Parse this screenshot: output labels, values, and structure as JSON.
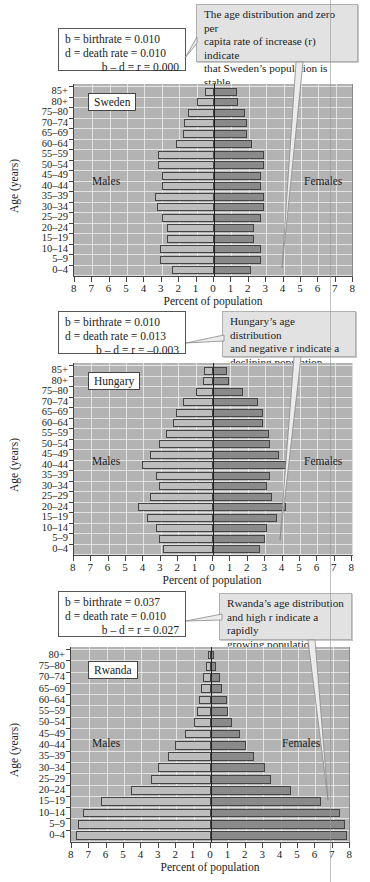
{
  "axis": {
    "x_ticks": [
      "8",
      "7",
      "6",
      "5",
      "4",
      "3",
      "2",
      "1",
      "0",
      "1",
      "2",
      "3",
      "4",
      "5",
      "6",
      "7",
      "8"
    ],
    "x_title": "Percent of population",
    "y_title": "Age (years)",
    "males_label": "Males",
    "females_label": "Females"
  },
  "panels": [
    {
      "country": "Sweden",
      "stats": {
        "b": "b =  birthrate = 0.010",
        "d": "d = death rate = 0.010",
        "r": "b – d = r = 0.000"
      },
      "callout": [
        "The age distribution and zero per",
        "capita rate of increase (r) indicate",
        "that Sweden’s population is stable."
      ]
    },
    {
      "country": "Hungary",
      "stats": {
        "b": "b =  birthrate = 0.010",
        "d": "d = death rate = 0.013",
        "r": "b – d = r = –0.003"
      },
      "callout": [
        "Hungary’s age distribution",
        "and negative r indicate a",
        "declining population."
      ]
    },
    {
      "country": "Rwanda",
      "stats": {
        "b": "b =  birthrate = 0.037",
        "d": "d = death rate = 0.010",
        "r": "b – d = r = 0.027"
      },
      "callout": [
        "Rwanda’s age distribution",
        "and high r indicate a rapidly",
        "growing population."
      ]
    }
  ],
  "chart_data": [
    {
      "type": "bar",
      "orientation": "horizontal-population-pyramid",
      "title": "Sweden",
      "xlabel": "Percent of population",
      "ylabel": "Age (years)",
      "xlim": [
        -8,
        8
      ],
      "grid": true,
      "categories": [
        "85+",
        "80+",
        "75–80",
        "70–74",
        "65–69",
        "60–64",
        "55–59",
        "50–54",
        "45–49",
        "40–44",
        "35–39",
        "30–34",
        "25–29",
        "20–24",
        "15–19",
        "10–14",
        "5–9",
        "0–4"
      ],
      "series": [
        {
          "name": "Males",
          "values": [
            0.5,
            1.0,
            1.5,
            1.7,
            1.8,
            2.2,
            3.2,
            3.2,
            3.0,
            3.0,
            3.4,
            3.3,
            3.0,
            2.7,
            2.7,
            3.1,
            3.1,
            2.4
          ]
        },
        {
          "name": "Females",
          "values": [
            1.3,
            1.4,
            1.8,
            1.9,
            1.9,
            2.2,
            2.9,
            2.9,
            2.7,
            2.7,
            2.9,
            2.9,
            2.7,
            2.3,
            2.3,
            2.7,
            2.7,
            2.1
          ]
        }
      ],
      "annotations": [
        "b = birthrate = 0.010",
        "d = death rate = 0.010",
        "b – d = r = 0.000",
        "The age distribution and zero per capita rate of increase (r) indicate that Sweden’s population is stable."
      ]
    },
    {
      "type": "bar",
      "orientation": "horizontal-population-pyramid",
      "title": "Hungary",
      "xlabel": "Percent of population",
      "ylabel": "Age (years)",
      "xlim": [
        -8,
        8
      ],
      "grid": true,
      "categories": [
        "85+",
        "80+",
        "75–80",
        "70–74",
        "65–69",
        "60–64",
        "55–59",
        "50–54",
        "45–49",
        "40–44",
        "35–39",
        "30–34",
        "25–29",
        "20–24",
        "15–19",
        "10–14",
        "5–9",
        "0–4"
      ],
      "series": [
        {
          "name": "Males",
          "values": [
            0.5,
            0.6,
            1.0,
            1.7,
            2.1,
            2.3,
            2.7,
            3.1,
            3.6,
            4.1,
            3.3,
            3.1,
            3.6,
            4.3,
            3.8,
            3.3,
            3.1,
            2.9
          ]
        },
        {
          "name": "Females",
          "values": [
            0.8,
            0.9,
            1.7,
            2.6,
            2.9,
            2.9,
            3.2,
            3.3,
            3.8,
            4.2,
            3.3,
            3.1,
            3.4,
            4.2,
            3.7,
            3.1,
            3.0,
            2.7
          ]
        }
      ],
      "annotations": [
        "b = birthrate = 0.010",
        "d = death rate = 0.013",
        "b – d = r = –0.003",
        "Hungary’s age distribution and negative r indicate a declining population."
      ]
    },
    {
      "type": "bar",
      "orientation": "horizontal-population-pyramid",
      "title": "Rwanda",
      "xlabel": "Percent of population",
      "ylabel": "Age (years)",
      "xlim": [
        -8,
        8
      ],
      "grid": true,
      "categories": [
        "80+",
        "75–80",
        "70–74",
        "65–69",
        "60–64",
        "55–59",
        "50–54",
        "45–49",
        "40–44",
        "35–39",
        "30–34",
        "25–29",
        "20–24",
        "15–19",
        "10–14",
        "5–9",
        "0–4"
      ],
      "series": [
        {
          "name": "Males",
          "values": [
            0.15,
            0.3,
            0.45,
            0.55,
            0.7,
            0.8,
            1.0,
            1.5,
            2.05,
            2.5,
            3.05,
            3.45,
            4.6,
            6.3,
            7.35,
            7.65,
            7.75
          ]
        },
        {
          "name": "Females",
          "values": [
            0.2,
            0.3,
            0.5,
            0.65,
            0.9,
            1.0,
            1.2,
            1.65,
            2.0,
            2.45,
            3.1,
            3.45,
            4.6,
            6.3,
            7.4,
            7.7,
            7.8
          ]
        }
      ],
      "annotations": [
        "b = birthrate = 0.037",
        "d = death rate = 0.010",
        "b – d = r = 0.027",
        "Rwanda’s age distribution and high r indicate a rapidly growing population."
      ]
    }
  ]
}
